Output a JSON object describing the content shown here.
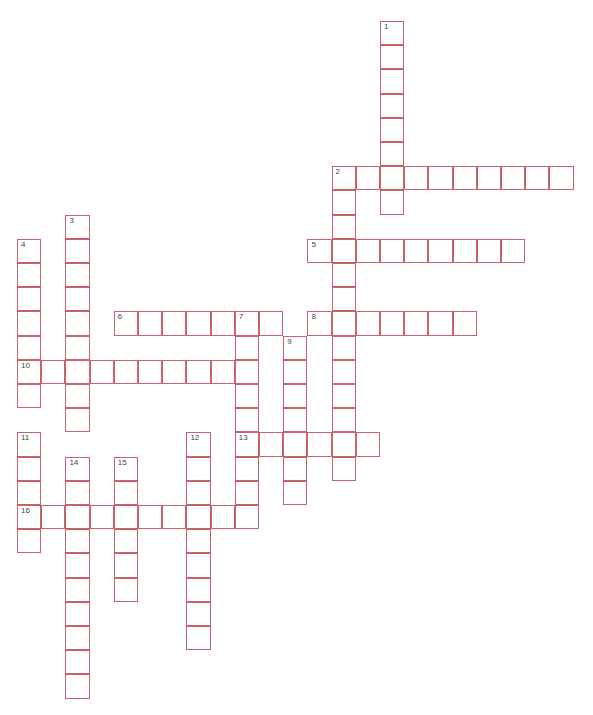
{
  "puzzle": {
    "type": "crossword",
    "grid_origin": {
      "x": 17,
      "y": 21
    },
    "cell_size": 24.2,
    "border_color": "#c9606a",
    "entries": [
      {
        "number": 1,
        "direction": "down",
        "col": 15,
        "row": 0,
        "length": 8
      },
      {
        "number": 2,
        "direction": "across",
        "col": 13,
        "row": 6,
        "length": 10
      },
      {
        "number": 2,
        "direction": "down",
        "col": 13,
        "row": 6,
        "length": 13
      },
      {
        "number": 3,
        "direction": "down",
        "col": 2,
        "row": 8,
        "length": 9
      },
      {
        "number": 4,
        "direction": "down",
        "col": 0,
        "row": 9,
        "length": 7
      },
      {
        "number": 5,
        "direction": "across",
        "col": 12,
        "row": 9,
        "length": 9
      },
      {
        "number": 6,
        "direction": "across",
        "col": 4,
        "row": 12,
        "length": 7
      },
      {
        "number": 7,
        "direction": "down",
        "col": 9,
        "row": 12,
        "length": 9
      },
      {
        "number": 8,
        "direction": "across",
        "col": 12,
        "row": 12,
        "length": 7
      },
      {
        "number": 9,
        "direction": "down",
        "col": 11,
        "row": 13,
        "length": 7
      },
      {
        "number": 10,
        "direction": "across",
        "col": 0,
        "row": 14,
        "length": 10
      },
      {
        "number": 11,
        "direction": "down",
        "col": 0,
        "row": 17,
        "length": 5
      },
      {
        "number": 12,
        "direction": "down",
        "col": 7,
        "row": 17,
        "length": 9
      },
      {
        "number": 13,
        "direction": "across",
        "col": 9,
        "row": 17,
        "length": 6
      },
      {
        "number": 14,
        "direction": "down",
        "col": 2,
        "row": 18,
        "length": 10
      },
      {
        "number": 15,
        "direction": "down",
        "col": 4,
        "row": 18,
        "length": 6
      },
      {
        "number": 16,
        "direction": "across",
        "col": 0,
        "row": 20,
        "length": 10
      }
    ]
  }
}
